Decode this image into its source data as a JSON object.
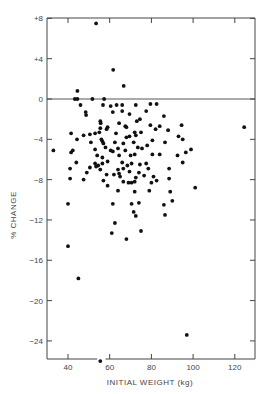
{
  "chart_data": {
    "type": "scatter",
    "title": "",
    "xlabel": "INITIAL WEIGHT (kg)",
    "ylabel": "% CHANGE",
    "xlim": [
      30,
      130
    ],
    "ylim": [
      -26,
      8
    ],
    "x_ticks": [
      40,
      60,
      80,
      100,
      120
    ],
    "x_tick_labels": [
      "40",
      "60",
      "80",
      "100",
      "120"
    ],
    "y_ticks": [
      8,
      4,
      0,
      -4,
      -8,
      -12,
      -16,
      -20,
      -24
    ],
    "y_tick_labels": [
      "+8",
      "+4",
      "0",
      "−4",
      "−8",
      "−12",
      "−16",
      "−20",
      "−24"
    ],
    "grid": false,
    "reference_line": {
      "y": 0,
      "style": "solid"
    },
    "legend": null,
    "marker_color": "#111111",
    "series": [
      {
        "name": "subjects",
        "points": [
          [
            53.5,
            7.5
          ],
          [
            61.7,
            2.9
          ],
          [
            66.7,
            1.3
          ],
          [
            44.5,
            0.8
          ],
          [
            43.3,
            0.0
          ],
          [
            44.5,
            0.0
          ],
          [
            51.7,
            0.0
          ],
          [
            57.3,
            0.0
          ],
          [
            46.0,
            -0.6
          ],
          [
            56.8,
            -0.6
          ],
          [
            60.5,
            -0.7
          ],
          [
            63.3,
            -0.6
          ],
          [
            66.0,
            -0.6
          ],
          [
            72.5,
            -0.6
          ],
          [
            79.5,
            -0.5
          ],
          [
            82.5,
            -0.5
          ],
          [
            48.5,
            -1.3
          ],
          [
            48.7,
            -1.6
          ],
          [
            61.5,
            -1.3
          ],
          [
            66.0,
            -1.2
          ],
          [
            69.5,
            -1.5
          ],
          [
            77.5,
            -1.2
          ],
          [
            86.0,
            -1.7
          ],
          [
            55.5,
            -2.2
          ],
          [
            55.7,
            -2.4
          ],
          [
            64.5,
            -2.4
          ],
          [
            67.5,
            -2.7
          ],
          [
            68.0,
            -2.8
          ],
          [
            73.0,
            -2.2
          ],
          [
            74.5,
            -2.0
          ],
          [
            79.5,
            -2.6
          ],
          [
            84.0,
            -2.7
          ],
          [
            55.5,
            -2.9
          ],
          [
            58.5,
            -3.0
          ],
          [
            59.0,
            -2.8
          ],
          [
            72.0,
            -3.3
          ],
          [
            75.0,
            -3.3
          ],
          [
            82.0,
            -3.0
          ],
          [
            88.0,
            -3.1
          ],
          [
            94.5,
            -2.6
          ],
          [
            41.5,
            -3.4
          ],
          [
            44.3,
            -4.0
          ],
          [
            47.5,
            -3.6
          ],
          [
            50.5,
            -3.5
          ],
          [
            53.0,
            -3.4
          ],
          [
            55.0,
            -3.3
          ],
          [
            63.0,
            -3.4
          ],
          [
            68.0,
            -3.8
          ],
          [
            69.5,
            -3.7
          ],
          [
            72.5,
            -3.6
          ],
          [
            51.0,
            -4.3
          ],
          [
            56.0,
            -4.0
          ],
          [
            56.5,
            -4.2
          ],
          [
            57.0,
            -4.4
          ],
          [
            62.5,
            -4.3
          ],
          [
            66.5,
            -4.4
          ],
          [
            71.5,
            -4.3
          ],
          [
            78.0,
            -4.6
          ],
          [
            80.5,
            -4.1
          ],
          [
            86.5,
            -4.3
          ],
          [
            93.0,
            -3.7
          ],
          [
            95.0,
            -4.0
          ],
          [
            33.0,
            -5.1
          ],
          [
            41.5,
            -5.3
          ],
          [
            42.3,
            -5.1
          ],
          [
            53.0,
            -5.0
          ],
          [
            58.0,
            -4.8
          ],
          [
            60.5,
            -5.1
          ],
          [
            61.5,
            -5.2
          ],
          [
            64.0,
            -4.9
          ],
          [
            67.5,
            -5.1
          ],
          [
            73.5,
            -4.8
          ],
          [
            75.5,
            -4.9
          ],
          [
            54.0,
            -5.6
          ],
          [
            56.5,
            -5.8
          ],
          [
            64.5,
            -5.6
          ],
          [
            70.0,
            -5.6
          ],
          [
            72.0,
            -5.5
          ],
          [
            80.5,
            -5.5
          ],
          [
            84.0,
            -5.5
          ],
          [
            92.5,
            -5.6
          ],
          [
            44.0,
            -6.3
          ],
          [
            53.0,
            -6.4
          ],
          [
            54.5,
            -6.6
          ],
          [
            56.5,
            -6.4
          ],
          [
            59.0,
            -6.2
          ],
          [
            66.0,
            -6.3
          ],
          [
            68.5,
            -6.6
          ],
          [
            70.5,
            -6.4
          ],
          [
            74.5,
            -6.5
          ],
          [
            77.5,
            -6.4
          ],
          [
            41.0,
            -6.9
          ],
          [
            50.5,
            -6.8
          ],
          [
            53.5,
            -6.7
          ],
          [
            55.5,
            -7.0
          ],
          [
            64.0,
            -7.0
          ],
          [
            66.5,
            -6.9
          ],
          [
            74.0,
            -7.3
          ],
          [
            78.5,
            -6.9
          ],
          [
            88.5,
            -6.9
          ],
          [
            95.0,
            -6.3
          ],
          [
            96.5,
            -5.3
          ],
          [
            99.0,
            -5.0
          ],
          [
            49.0,
            -7.3
          ],
          [
            58.5,
            -7.5
          ],
          [
            62.0,
            -7.5
          ],
          [
            64.5,
            -7.4
          ],
          [
            65.0,
            -7.7
          ],
          [
            69.5,
            -7.2
          ],
          [
            72.5,
            -7.8
          ],
          [
            76.5,
            -7.6
          ],
          [
            81.0,
            -7.7
          ],
          [
            41.0,
            -7.9
          ],
          [
            47.5,
            -8.0
          ],
          [
            57.0,
            -8.1
          ],
          [
            59.0,
            -8.6
          ],
          [
            66.5,
            -8.2
          ],
          [
            69.0,
            -8.3
          ],
          [
            70.5,
            -8.3
          ],
          [
            72.0,
            -8.2
          ],
          [
            80.0,
            -8.3
          ],
          [
            82.5,
            -8.1
          ],
          [
            88.5,
            -7.9
          ],
          [
            64.0,
            -9.1
          ],
          [
            72.0,
            -9.2
          ],
          [
            79.0,
            -9.1
          ],
          [
            89.0,
            -9.2
          ],
          [
            101.0,
            -8.8
          ],
          [
            40.0,
            -10.4
          ],
          [
            61.5,
            -10.4
          ],
          [
            70.5,
            -10.4
          ],
          [
            74.0,
            -10.3
          ],
          [
            86.0,
            -10.5
          ],
          [
            90.0,
            -10.1
          ],
          [
            71.5,
            -11.2
          ],
          [
            72.5,
            -11.6
          ],
          [
            86.5,
            -11.5
          ],
          [
            62.5,
            -12.3
          ],
          [
            61.0,
            -13.3
          ],
          [
            75.0,
            -13.1
          ],
          [
            68.0,
            -13.9
          ],
          [
            40.0,
            -14.6
          ],
          [
            45.0,
            -17.8
          ],
          [
            97.0,
            -23.4
          ],
          [
            55.5,
            -26.0
          ],
          [
            124.5,
            -2.8
          ]
        ]
      }
    ]
  },
  "layout": {
    "plot_left_px": 47,
    "plot_right_px": 255,
    "plot_top_px": 18,
    "plot_bottom_px": 359,
    "x_px_at_40": 68,
    "x_px_per_unit": 2.085,
    "y_px_at_0": 99,
    "y_px_per_unit": 10.08
  }
}
